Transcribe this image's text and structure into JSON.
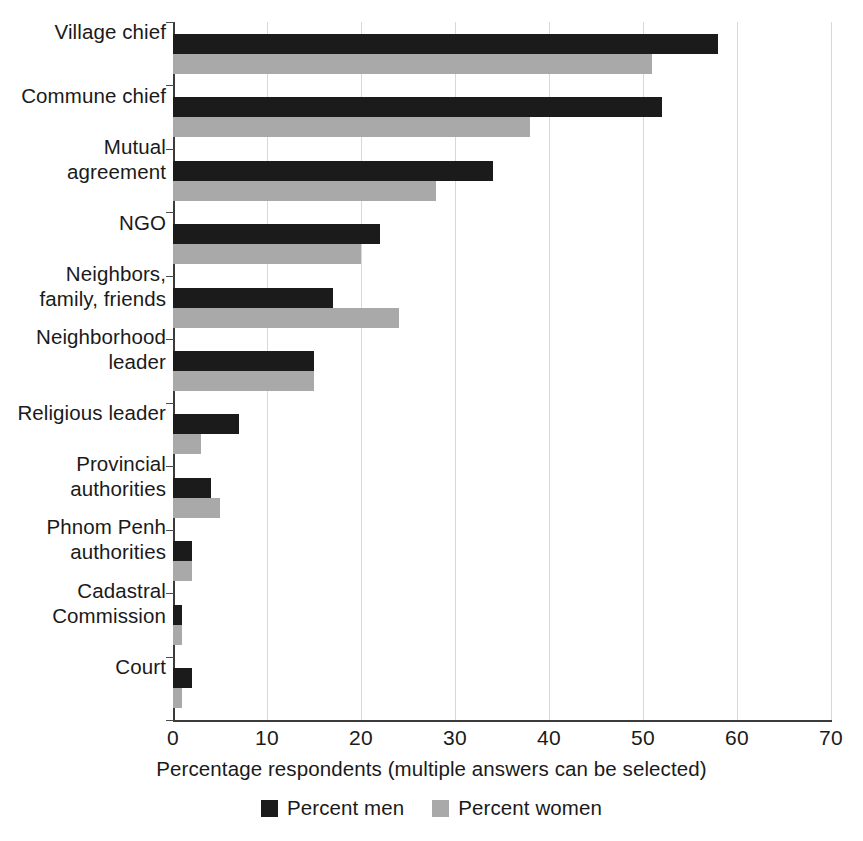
{
  "chart_data": {
    "type": "bar",
    "orientation": "horizontal",
    "title": "",
    "xlabel": "Percentage respondents (multiple answers can be selected)",
    "ylabel": "",
    "xlim": [
      0,
      70
    ],
    "xticks": [
      0,
      10,
      20,
      30,
      40,
      50,
      60,
      70
    ],
    "xtick_labels": [
      "0",
      "10",
      "20",
      "30",
      "40",
      "50",
      "60",
      "70"
    ],
    "grid": true,
    "grid_axis": "x",
    "legend_position": "bottom-center",
    "categories": [
      "Village chief",
      "Commune chief",
      "Mutual\nagreement",
      "NGO",
      "Neighbors,\nfamily, friends",
      "Neighborhood\nleader",
      "Religious leader",
      "Provincial\nauthorities",
      "Phnom Penh\nauthorities",
      "Cadastral\nCommission",
      "Court"
    ],
    "series": [
      {
        "name": "Percent men",
        "color": "#1b1b1b",
        "values": [
          58,
          52,
          34,
          22,
          17,
          15,
          7,
          4,
          2,
          1,
          2
        ]
      },
      {
        "name": "Percent women",
        "color": "#a9a9a9",
        "values": [
          51,
          38,
          28,
          20,
          24,
          15,
          3,
          5,
          2,
          1,
          1
        ]
      }
    ]
  },
  "legend": {
    "items": [
      {
        "label": "Percent men",
        "color": "#1b1b1b"
      },
      {
        "label": "Percent women",
        "color": "#a9a9a9"
      }
    ]
  }
}
